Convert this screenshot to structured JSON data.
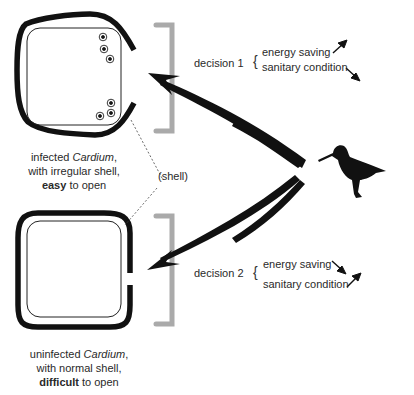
{
  "diagram": {
    "shell_infected": {
      "caption_line1_pre": "infected ",
      "caption_line1_italic": "Cardium",
      "caption_line1_post": ",",
      "caption_line2": "with irregular shell,",
      "caption_line3_bold": "easy",
      "caption_line3_post": " to open"
    },
    "shell_uninfected": {
      "caption_line1_pre": "uninfected ",
      "caption_line1_italic": "Cardium",
      "caption_line1_post": ",",
      "caption_line2": "with normal shell,",
      "caption_line3_bold": "difficult",
      "caption_line3_post": " to open"
    },
    "shell_label": "(shell)",
    "decision1": {
      "label": "decision 1",
      "brace": "{",
      "factors": [
        "energy saving",
        "sanitary condition"
      ],
      "arrows": [
        "up",
        "down"
      ]
    },
    "decision2": {
      "label": "decision 2",
      "brace": "{",
      "factors": [
        "energy saving",
        "sanitary condition"
      ],
      "arrows": [
        "down",
        "up"
      ]
    },
    "colors": {
      "shell": "#111111",
      "bracket": "#aaaaaa",
      "arrow": "#111111",
      "bird": "#111111"
    }
  }
}
